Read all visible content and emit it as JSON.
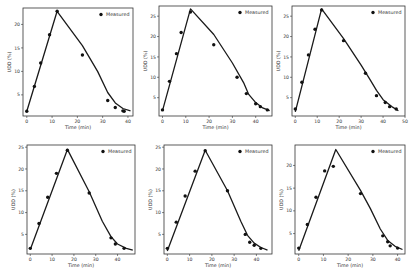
{
  "figure": {
    "background": "#ffffff",
    "line_color": "#1a1a1a",
    "marker_color": "#111111"
  },
  "chart_data": [
    {
      "type": "line",
      "panel": 1,
      "title": "",
      "xlabel": "Time (min)",
      "ylabel": "UDD (%)",
      "xlim": [
        -1.5,
        42
      ],
      "ylim": [
        0.5,
        23.5
      ],
      "xticks": [
        0,
        10,
        20,
        30,
        40
      ],
      "yticks": [
        5,
        10,
        15,
        20
      ],
      "legend": {
        "entries": [
          "Measured"
        ],
        "position": "upper right"
      },
      "series": [
        {
          "name": "Measured",
          "style": "scatter",
          "x": [
            0,
            3,
            5.5,
            9,
            12,
            22,
            32,
            35,
            38,
            38.5
          ],
          "y": [
            1.5,
            6.8,
            11.8,
            17.8,
            22.8,
            13.5,
            3.8,
            2.3,
            1.6,
            1.5
          ]
        },
        {
          "name": "Model",
          "style": "line",
          "x": [
            0,
            12,
            22,
            28,
            32,
            35,
            38,
            41
          ],
          "y": [
            1.5,
            22.8,
            15.5,
            10.0,
            5.5,
            3.3,
            2.1,
            1.6
          ]
        }
      ],
      "box": {
        "x0": 23,
        "y0": 8,
        "x1": 133,
        "y1": 116
      }
    },
    {
      "type": "line",
      "panel": 2,
      "xlabel": "Time (min)",
      "ylabel": "UDD (%)",
      "xlim": [
        -1.5,
        47
      ],
      "ylim": [
        0.5,
        27.5
      ],
      "xticks": [
        0,
        10,
        20,
        30,
        40
      ],
      "yticks": [
        5,
        10,
        15,
        20,
        25
      ],
      "legend": {
        "entries": [
          "Measured"
        ],
        "position": "upper right"
      },
      "series": [
        {
          "name": "Measured",
          "style": "scatter",
          "x": [
            0,
            3,
            6,
            8,
            12,
            22,
            32,
            36,
            40,
            42,
            45
          ],
          "y": [
            2.0,
            9.0,
            15.8,
            21.0,
            26.0,
            18.0,
            10.0,
            6.0,
            3.5,
            2.8,
            2.0
          ]
        },
        {
          "name": "Model",
          "style": "line",
          "x": [
            0,
            12,
            22,
            30,
            35,
            37,
            40,
            43,
            46
          ],
          "y": [
            1.8,
            26.8,
            20.5,
            13.5,
            8.5,
            5.8,
            3.8,
            2.5,
            1.8
          ]
        }
      ],
      "box": {
        "x0": 159,
        "y0": 6,
        "x1": 272,
        "y1": 116
      }
    },
    {
      "type": "line",
      "panel": 3,
      "xlabel": "Time (min)",
      "ylabel": "UDD (%)",
      "xlim": [
        -1.5,
        50
      ],
      "ylim": [
        0.5,
        27.5
      ],
      "xticks": [
        0,
        10,
        20,
        30,
        40,
        50
      ],
      "yticks": [
        5,
        10,
        15,
        20,
        25
      ],
      "legend": {
        "entries": [
          "Measured"
        ],
        "position": "upper right"
      },
      "series": [
        {
          "name": "Measured",
          "style": "scatter",
          "x": [
            0,
            3,
            6,
            9,
            12,
            22,
            32,
            37,
            41,
            43,
            46
          ],
          "y": [
            2.2,
            8.8,
            15.5,
            21.8,
            26.5,
            19.0,
            11.0,
            5.5,
            3.8,
            2.8,
            2.2
          ]
        },
        {
          "name": "Model",
          "style": "line",
          "x": [
            0,
            12,
            22,
            30,
            34,
            37,
            40,
            44,
            47
          ],
          "y": [
            1.5,
            26.8,
            19.5,
            13.0,
            9.5,
            6.8,
            4.5,
            2.8,
            1.8
          ]
        }
      ],
      "box": {
        "x0": 292,
        "y0": 6,
        "x1": 405,
        "y1": 116
      }
    },
    {
      "type": "line",
      "panel": 4,
      "xlabel": "Time (min)",
      "ylabel": "UDD (%)",
      "xlim": [
        -1.5,
        48
      ],
      "ylim": [
        0.5,
        25.5
      ],
      "xticks": [
        0,
        10,
        20,
        30,
        40
      ],
      "yticks": [
        5,
        10,
        15,
        20,
        25
      ],
      "legend": {
        "entries": [
          "Measured"
        ],
        "position": "upper right"
      },
      "series": [
        {
          "name": "Measured",
          "style": "scatter",
          "x": [
            0,
            4,
            8,
            12,
            17,
            27,
            37,
            39,
            43
          ],
          "y": [
            1.8,
            7.5,
            13.5,
            19.0,
            24.3,
            14.5,
            4.2,
            2.8,
            1.8
          ]
        },
        {
          "name": "Model",
          "style": "line",
          "x": [
            0,
            17,
            27,
            33,
            37,
            40,
            44,
            47
          ],
          "y": [
            1.5,
            24.5,
            14.8,
            8.0,
            4.5,
            2.8,
            1.8,
            1.4
          ]
        }
      ],
      "box": {
        "x0": 27,
        "y0": 145,
        "x1": 135,
        "y1": 254
      }
    },
    {
      "type": "line",
      "panel": 5,
      "xlabel": "Time (min)",
      "ylabel": "UDD (%)",
      "xlim": [
        -1.5,
        47
      ],
      "ylim": [
        0.5,
        25.5
      ],
      "xticks": [
        0,
        10,
        20,
        30,
        40
      ],
      "yticks": [
        5,
        10,
        15,
        20,
        25
      ],
      "legend": {
        "entries": [
          "Measured"
        ],
        "position": "upper right"
      },
      "series": [
        {
          "name": "Measured",
          "style": "scatter",
          "x": [
            0,
            4,
            8,
            12.5,
            17,
            27,
            35,
            37,
            39,
            42
          ],
          "y": [
            1.8,
            7.8,
            13.8,
            19.5,
            24.2,
            15.0,
            5.0,
            3.2,
            2.5,
            1.8
          ]
        },
        {
          "name": "Model",
          "style": "line",
          "x": [
            0,
            17,
            27,
            33,
            36,
            39,
            42,
            45
          ],
          "y": [
            1.2,
            24.3,
            15.0,
            8.0,
            4.8,
            3.0,
            2.0,
            1.4
          ]
        }
      ],
      "box": {
        "x0": 164,
        "y0": 145,
        "x1": 272,
        "y1": 254
      }
    },
    {
      "type": "line",
      "panel": 6,
      "xlabel": "Time (min)",
      "ylabel": "UDD (%)",
      "xlim": [
        -1.5,
        43
      ],
      "ylim": [
        0.5,
        24.5
      ],
      "xticks": [
        0,
        10,
        20,
        30,
        40
      ],
      "yticks": [
        5,
        10,
        15,
        20
      ],
      "legend": {
        "entries": [
          "Measured"
        ],
        "position": "upper right"
      },
      "series": [
        {
          "name": "Measured",
          "style": "scatter",
          "x": [
            0,
            3.5,
            7,
            10.5,
            14,
            25,
            34,
            36,
            37,
            40
          ],
          "y": [
            1.8,
            7.0,
            13.0,
            18.8,
            19.8,
            13.8,
            4.5,
            3.2,
            2.3,
            1.8
          ]
        },
        {
          "name": "Model",
          "style": "line",
          "x": [
            0,
            15,
            25,
            29,
            33,
            36,
            39,
            42
          ],
          "y": [
            1.2,
            23.5,
            14.5,
            10.5,
            6.0,
            3.5,
            2.2,
            1.5
          ]
        }
      ],
      "box": {
        "x0": 295,
        "y0": 145,
        "x1": 405,
        "y1": 254
      }
    }
  ]
}
